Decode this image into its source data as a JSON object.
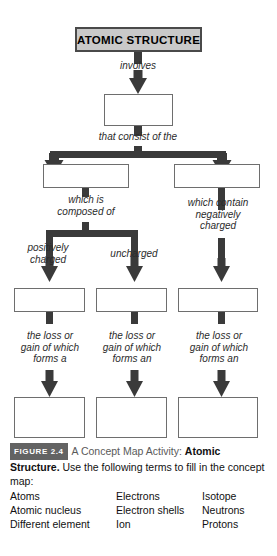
{
  "figure": {
    "title_node": {
      "label": "ATOMIC STRUCTURE",
      "fill_color": "#c9c9c9",
      "border_color": "#4a4a4a"
    },
    "connector_labels": [
      {
        "id": "involves",
        "text": "involves"
      },
      {
        "id": "that-consist-of-the",
        "text": "that consist of the"
      },
      {
        "id": "which-is-composed-of",
        "text": "which is\ncomposed of"
      },
      {
        "id": "which-contain-negatively-charged",
        "text": "which contain\nnegatively\ncharged"
      },
      {
        "id": "positively-charged",
        "text": "positively\ncharged"
      },
      {
        "id": "uncharged",
        "text": "uncharged"
      },
      {
        "id": "the-loss-or-gain-of-which-forms-a",
        "text": "the loss or\ngain of which\nforms a"
      },
      {
        "id": "the-loss-or-gain-of-which-forms-an-center",
        "text": "the loss or\ngain of which\nforms an"
      },
      {
        "id": "the-loss-or-gain-of-which-forms-an-right",
        "text": "the loss or\ngain of which\nforms an"
      }
    ],
    "blank_boxes": [
      {
        "id": "blank-level-1",
        "label": ""
      },
      {
        "id": "blank-level-2-left",
        "label": ""
      },
      {
        "id": "blank-level-2-right",
        "label": ""
      },
      {
        "id": "blank-level-3-left",
        "label": ""
      },
      {
        "id": "blank-level-3-center",
        "label": ""
      },
      {
        "id": "blank-level-3-right",
        "label": ""
      },
      {
        "id": "blank-level-4-left",
        "label": ""
      },
      {
        "id": "blank-level-4-center",
        "label": ""
      },
      {
        "id": "blank-level-4-right",
        "label": ""
      }
    ],
    "line_color": "#3a3a3a",
    "box_border_color": "#6e6e6e"
  },
  "caption": {
    "badge": "FIGURE 2.4",
    "activity_label": "A Concept Map Activity:",
    "subject_bold": "Atomic Structure.",
    "instruction": "Use the following terms to fill in the concept map:"
  },
  "terms": {
    "columns": [
      {
        "items": [
          "Atoms",
          "Atomic nucleus",
          "Different element"
        ]
      },
      {
        "items": [
          "Electrons",
          "Electron shells",
          "Ion"
        ]
      },
      {
        "items": [
          "Isotope",
          "Neutrons",
          "Protons"
        ]
      }
    ]
  }
}
